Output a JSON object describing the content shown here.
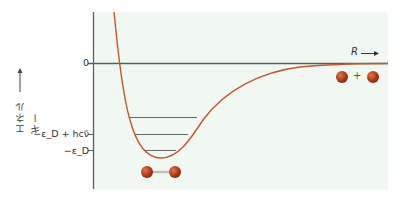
{
  "diagram": {
    "y_axis_label": "エネルギー",
    "x_axis_label": "R",
    "tick_labels": {
      "zero": "0",
      "dissociation_plus_zpe": "−ε_D + hcν̃",
      "dissociation": "−ε_D"
    },
    "plus_sign": "+",
    "colors": {
      "curve": "#c8552a",
      "axis": "#5a5f5e",
      "levels": "#5f6b68",
      "background": "#f1f8f2",
      "atom": "#b8401d"
    },
    "vibrational_levels": [
      {
        "y": 117,
        "x1": 129,
        "x2": 197
      },
      {
        "y": 134,
        "x1": 135,
        "x2": 188
      },
      {
        "y": 150,
        "x1": 145,
        "x2": 176
      }
    ],
    "molecule_label": "bonded molecule (two atoms joined)",
    "separated_atoms_label": "separated atoms"
  }
}
